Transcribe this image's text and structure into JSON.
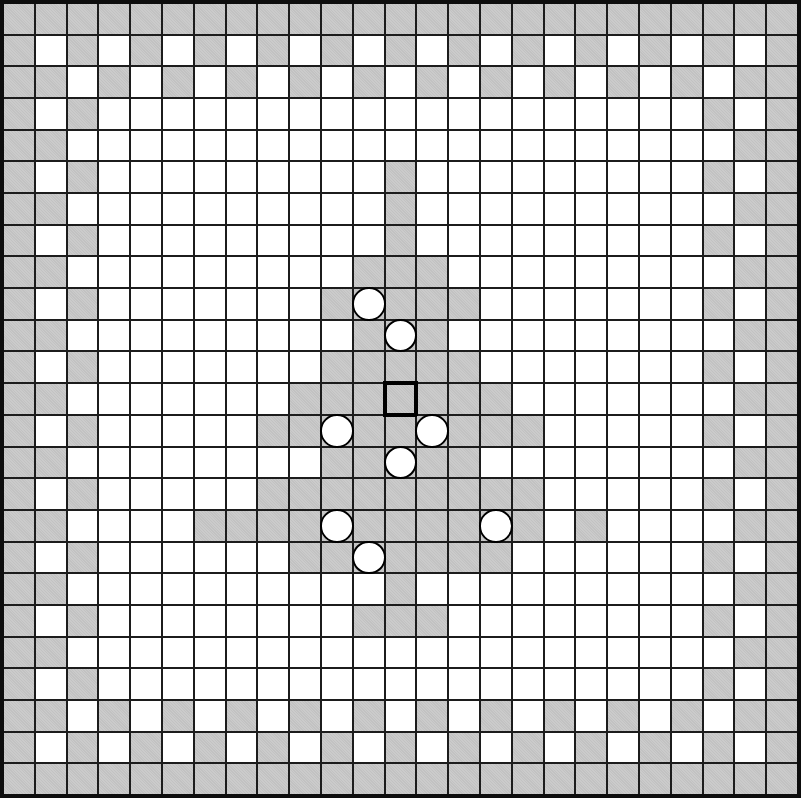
{
  "board": {
    "rows": 25,
    "cols": 25,
    "colors": {
      "background": "#ffffff",
      "cell_white": "#ffffff",
      "cell_gray": "#c6c6c6",
      "grid_line": "#1c1c1c",
      "outer_border": "#0d0d0d",
      "piece_fill": "#ffffff",
      "piece_outline": "#000000",
      "marker_outline": "#000000"
    },
    "gray_cols_by_row": [
      [
        0,
        1,
        2,
        3,
        4,
        5,
        6,
        7,
        8,
        9,
        10,
        11,
        12,
        13,
        14,
        15,
        16,
        17,
        18,
        19,
        20,
        21,
        22,
        23,
        24
      ],
      [
        0,
        2,
        4,
        6,
        8,
        10,
        12,
        14,
        16,
        18,
        20,
        22,
        24
      ],
      [
        0,
        1,
        3,
        5,
        7,
        9,
        11,
        13,
        15,
        17,
        19,
        21,
        23,
        24
      ],
      [
        0,
        2,
        22,
        24
      ],
      [
        0,
        1,
        23,
        24
      ],
      [
        0,
        2,
        12,
        22,
        24
      ],
      [
        0,
        1,
        12,
        23,
        24
      ],
      [
        0,
        2,
        12,
        22,
        24
      ],
      [
        0,
        1,
        11,
        12,
        13,
        23,
        24
      ],
      [
        0,
        2,
        10,
        11,
        12,
        13,
        14,
        22,
        24
      ],
      [
        0,
        1,
        11,
        12,
        13,
        23,
        24
      ],
      [
        0,
        2,
        10,
        11,
        12,
        13,
        14,
        22,
        24
      ],
      [
        0,
        1,
        9,
        10,
        11,
        12,
        13,
        14,
        15,
        23,
        24
      ],
      [
        0,
        2,
        8,
        9,
        10,
        11,
        12,
        13,
        14,
        15,
        16,
        22,
        24
      ],
      [
        0,
        1,
        10,
        11,
        12,
        13,
        14,
        23,
        24
      ],
      [
        0,
        2,
        8,
        9,
        10,
        11,
        12,
        13,
        14,
        15,
        16,
        22,
        24
      ],
      [
        0,
        1,
        6,
        7,
        8,
        9,
        10,
        11,
        12,
        13,
        14,
        15,
        16,
        18,
        23,
        24
      ],
      [
        0,
        2,
        9,
        10,
        11,
        12,
        13,
        14,
        15,
        22,
        24
      ],
      [
        0,
        1,
        12,
        23,
        24
      ],
      [
        0,
        2,
        11,
        12,
        13,
        22,
        24
      ],
      [
        0,
        1,
        23,
        24
      ],
      [
        0,
        2,
        22,
        24
      ],
      [
        0,
        1,
        3,
        5,
        7,
        9,
        11,
        13,
        15,
        17,
        19,
        21,
        23,
        24
      ],
      [
        0,
        2,
        4,
        6,
        8,
        10,
        12,
        14,
        16,
        18,
        20,
        22,
        24
      ],
      [
        0,
        1,
        2,
        3,
        4,
        5,
        6,
        7,
        8,
        9,
        10,
        11,
        12,
        13,
        14,
        15,
        16,
        17,
        18,
        19,
        20,
        21,
        22,
        23,
        24
      ]
    ],
    "pieces": [
      [
        9,
        11
      ],
      [
        10,
        12
      ],
      [
        13,
        10
      ],
      [
        13,
        13
      ],
      [
        14,
        12
      ],
      [
        16,
        10
      ],
      [
        16,
        15
      ],
      [
        17,
        11
      ]
    ],
    "marker_cell": [
      12,
      12
    ]
  }
}
